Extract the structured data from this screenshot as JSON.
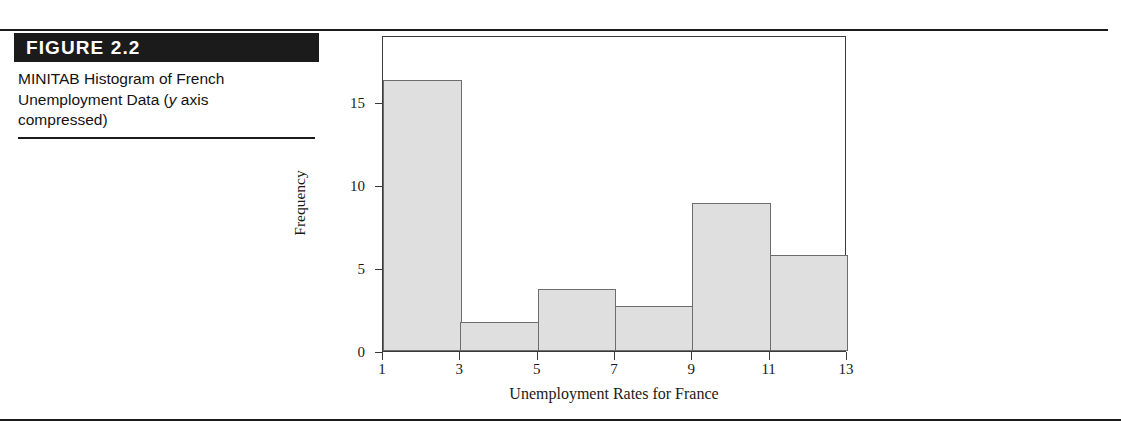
{
  "figure": {
    "number_label": "FIGURE 2.2",
    "caption_line1": "MINITAB Histogram of French",
    "caption_line2_pre": "Unemployment Data (",
    "caption_italic": "y",
    "caption_line2_post": " axis",
    "caption_line3": "compressed)"
  },
  "colors": {
    "bar_fill": "#dfdfdf",
    "bar_stroke": "#6d6d6d",
    "axis": "#3a3a3a",
    "header_bar": "#1b1b1b",
    "rule": "#1a1a1a",
    "text": "#131313"
  },
  "chart_data": {
    "type": "bar",
    "title": "",
    "subtitle": "",
    "xlabel": "Unemployment Rates for France",
    "ylabel": "Frequency",
    "grid": false,
    "legend": false,
    "bin_edges": [
      1,
      3,
      5,
      7,
      9,
      11,
      13
    ],
    "categories": [
      "1-3",
      "3-5",
      "5-7",
      "7-9",
      "9-11",
      "11-13"
    ],
    "values": [
      16.3,
      1.75,
      3.75,
      2.7,
      8.9,
      5.8
    ],
    "xlim": [
      1,
      13
    ],
    "ylim": [
      0,
      19
    ],
    "xticks": [
      "1",
      "3",
      "5",
      "7",
      "9",
      "11",
      "13"
    ],
    "xtick_values": [
      1,
      3,
      5,
      7,
      9,
      11,
      13
    ],
    "yticks": [
      "0",
      "5",
      "10",
      "15"
    ],
    "ytick_values": [
      0,
      5,
      10,
      15
    ]
  }
}
